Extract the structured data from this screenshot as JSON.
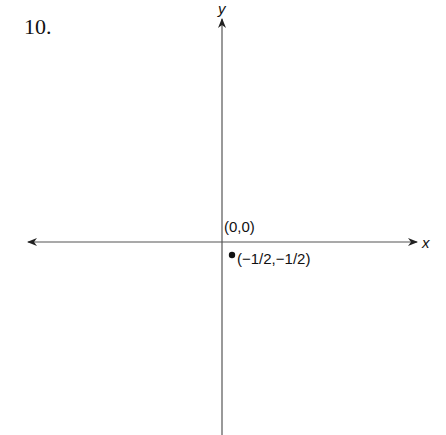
{
  "problem_number": "10.",
  "chart_data": {
    "type": "scatter",
    "title": "",
    "xlabel": "x",
    "ylabel": "y",
    "xlim": [
      -3,
      3
    ],
    "ylim": [
      -3,
      3
    ],
    "grid": false,
    "origin_label": "(0,0)",
    "points": [
      {
        "x": -0.5,
        "y": -0.5,
        "label": "(−1/2,−1/2)"
      }
    ]
  }
}
